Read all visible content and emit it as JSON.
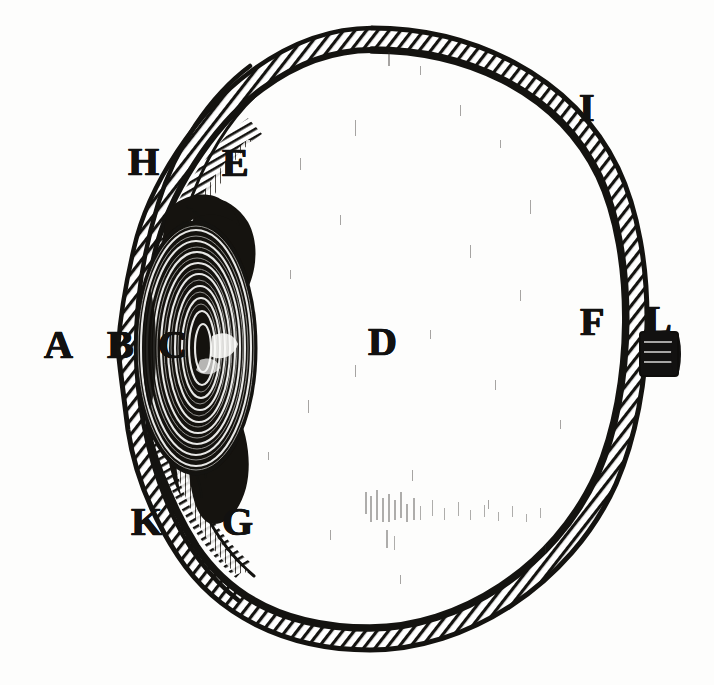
{
  "figure": {
    "kind": "anatomical-engraving",
    "style": "copperplate line engraving, black ink on aged paper",
    "background_color": "#fdfdfc",
    "ink_color": "#121110",
    "canvas": {
      "width": 714,
      "height": 685
    }
  },
  "labels": [
    {
      "id": "A",
      "text": "A",
      "x": 44,
      "y": 325,
      "role": "label-a",
      "on_dark": false
    },
    {
      "id": "B",
      "text": "B",
      "x": 107,
      "y": 325,
      "role": "label-b",
      "on_dark": false
    },
    {
      "id": "C",
      "text": "C",
      "x": 158,
      "y": 325,
      "role": "label-c",
      "on_dark": true
    },
    {
      "id": "D",
      "text": "D",
      "x": 368,
      "y": 322,
      "role": "label-d",
      "on_dark": false
    },
    {
      "id": "E",
      "text": "E",
      "x": 222,
      "y": 143,
      "role": "label-e",
      "on_dark": false
    },
    {
      "id": "F",
      "text": "F",
      "x": 580,
      "y": 302,
      "role": "label-f",
      "on_dark": false
    },
    {
      "id": "G",
      "text": "G",
      "x": 222,
      "y": 502,
      "role": "label-g",
      "on_dark": false
    },
    {
      "id": "H",
      "text": "H",
      "x": 128,
      "y": 142,
      "role": "label-h",
      "on_dark": false
    },
    {
      "id": "I",
      "text": "I",
      "x": 579,
      "y": 88,
      "role": "label-i",
      "on_dark": false
    },
    {
      "id": "K",
      "text": "K",
      "x": 131,
      "y": 502,
      "role": "label-k",
      "on_dark": false
    },
    {
      "id": "L",
      "text": "L",
      "x": 645,
      "y": 300,
      "role": "label-l",
      "on_dark": false
    }
  ],
  "structures": {
    "sclera": {
      "name": "sclera-outer-coat",
      "fill": "#ffffff",
      "stroke": "#141310",
      "hatched": true
    },
    "vitreous": {
      "name": "vitreous-chamber",
      "fill": "#fdfdfc"
    },
    "cornea": {
      "name": "cornea",
      "stroke": "#141310"
    },
    "anterior_chamber": {
      "name": "anterior-chamber",
      "fill": "#fdfdfc"
    },
    "lens": {
      "name": "crystalline-lens",
      "fill": "#15130f"
    },
    "iris": {
      "name": "iris",
      "fill": "#15130f"
    },
    "optic_nerve": {
      "name": "optic-nerve-stub",
      "fill": "#121110"
    }
  }
}
